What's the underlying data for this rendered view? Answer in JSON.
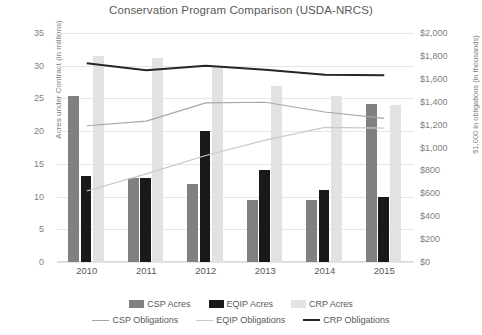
{
  "chart_data": {
    "type": "bar",
    "title": "Conservation Program Comparison (USDA-NRCS)",
    "categories": [
      "2010",
      "2011",
      "2012",
      "2013",
      "2014",
      "2015"
    ],
    "xlabel": "",
    "ylabel": "Acres under Contract (in millions)",
    "ylabel_secondary": "$1,000 in obligations (in thousands)",
    "ylim": [
      0,
      35
    ],
    "ytick_step": 5,
    "yticks": [
      "0",
      "5",
      "10",
      "15",
      "20",
      "25",
      "30",
      "35"
    ],
    "ylim_secondary": [
      0,
      2000
    ],
    "ytick_step_secondary": 200,
    "yticks_secondary": [
      "$0",
      "$200",
      "$400",
      "$600",
      "$800",
      "$1,000",
      "$1,200",
      "$1,400",
      "$1,600",
      "$1,800",
      "$2,000"
    ],
    "grid": true,
    "legend_position": "bottom",
    "bar_series": [
      {
        "name": "CSP Acres",
        "axis": "left",
        "color": "#808080",
        "values": [
          25.3,
          12.8,
          12.0,
          9.5,
          9.5,
          24.1
        ]
      },
      {
        "name": "EQIP Acres",
        "axis": "left",
        "color": "#191919",
        "values": [
          13.2,
          12.9,
          20.0,
          14.0,
          11.0,
          9.9
        ]
      },
      {
        "name": "CRP Acres",
        "axis": "left",
        "color": "#e2e2e2",
        "values": [
          31.5,
          31.2,
          29.9,
          26.9,
          25.3,
          24.0
        ]
      }
    ],
    "line_series": [
      {
        "name": "CSP Obligations",
        "axis": "right",
        "color": "#a6a6a6",
        "values": [
          1190,
          1230,
          1390,
          1395,
          1310,
          1255
        ]
      },
      {
        "name": "EQIP Obligations",
        "axis": "right",
        "color": "#c9c9c9",
        "values": [
          620,
          770,
          930,
          1065,
          1175,
          1170
        ]
      },
      {
        "name": "CRP Obligations",
        "axis": "right",
        "color": "#262626",
        "values": [
          1735,
          1675,
          1715,
          1680,
          1635,
          1630
        ]
      }
    ]
  }
}
